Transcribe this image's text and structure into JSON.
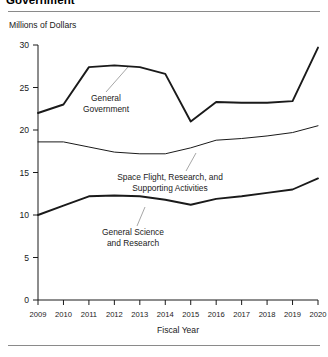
{
  "figure": {
    "title": "Government",
    "units_label": "Millions of Dollars"
  },
  "chart_data": {
    "type": "line",
    "title": "Government",
    "xlabel": "Fiscal Year",
    "ylabel": "Millions of Dollars",
    "categories": [
      "2009",
      "2010",
      "2011",
      "2012",
      "2013",
      "2014",
      "2015",
      "2016",
      "2017",
      "2018",
      "2019",
      "2020"
    ],
    "x": [
      2009,
      2010,
      2011,
      2012,
      2013,
      2014,
      2015,
      2016,
      2017,
      2018,
      2019,
      2020
    ],
    "xlim": [
      2009,
      2020
    ],
    "ylim": [
      0,
      30
    ],
    "yticks": [
      0,
      5,
      10,
      15,
      20,
      25,
      30
    ],
    "xticks": [
      "2009",
      "2010",
      "2011",
      "2012",
      "2013",
      "2014",
      "2015",
      "2016",
      "2017",
      "2018",
      "2019",
      "2020"
    ],
    "grid": false,
    "legend": "inline-annotations",
    "series": [
      {
        "name": "General Government",
        "label_line1": "General",
        "label_line2": "Government",
        "values": [
          22.0,
          23.0,
          27.4,
          27.6,
          27.4,
          26.6,
          21.0,
          23.3,
          23.2,
          23.2,
          23.4,
          29.7
        ]
      },
      {
        "name": "Space Flight, Research, and Supporting Activities",
        "label_line1": "Space Flight, Research, and",
        "label_line2": "Supporting Activities",
        "values": [
          18.6,
          18.6,
          18.0,
          17.4,
          17.2,
          17.2,
          17.9,
          18.8,
          19.0,
          19.3,
          19.7,
          20.5
        ]
      },
      {
        "name": "General Science and Research",
        "label_line1": "General Science",
        "label_line2": "and Research",
        "values": [
          10.0,
          11.1,
          12.2,
          12.3,
          12.2,
          11.8,
          11.2,
          11.9,
          12.2,
          12.6,
          13.0,
          14.3
        ]
      }
    ]
  },
  "axis": {
    "x_title": "Fiscal Year"
  }
}
